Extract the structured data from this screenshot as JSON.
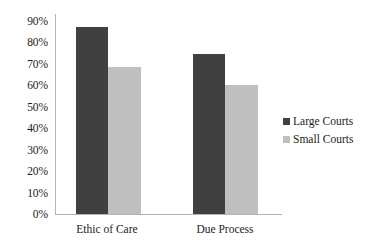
{
  "chart_data": {
    "type": "bar",
    "title": "",
    "subtitle": "",
    "xlabel": "",
    "ylabel": "",
    "categories": [
      "Ethic of Care",
      "Due Process"
    ],
    "series": [
      {
        "name": "Large Courts",
        "color": "#404040",
        "values": [
          84,
          72
        ]
      },
      {
        "name": "Small Courts",
        "color": "#bfbfbf",
        "values": [
          66,
          58
        ]
      }
    ],
    "ylim": [
      0,
      90
    ],
    "ytick_labels": [
      "90%",
      "80%",
      "70%",
      "60%",
      "50%",
      "40%",
      "30%",
      "20%",
      "10%",
      "0%"
    ],
    "ytick_values": [
      90,
      80,
      70,
      60,
      50,
      40,
      30,
      20,
      10,
      0
    ],
    "value_format": "percent",
    "grid": false,
    "legend_position": "right",
    "background_color": "#ffffff",
    "axis_color": "#b5b5b5"
  },
  "axis": {
    "y_ticks": [
      {
        "label": "90%"
      },
      {
        "label": "80%"
      },
      {
        "label": "70%"
      },
      {
        "label": "60%"
      },
      {
        "label": "50%"
      },
      {
        "label": "40%"
      },
      {
        "label": "30%"
      },
      {
        "label": "20%"
      },
      {
        "label": "10%"
      },
      {
        "label": "0%"
      }
    ],
    "x_categories": [
      {
        "label": "Ethic of Care"
      },
      {
        "label": "Due Process"
      }
    ]
  },
  "legend": {
    "items": [
      {
        "label": "Large Courts",
        "color": "#404040"
      },
      {
        "label": "Small Courts",
        "color": "#bfbfbf"
      }
    ]
  }
}
